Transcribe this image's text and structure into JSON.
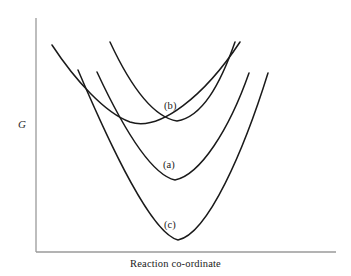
{
  "figure": {
    "kind": "free-energy-vs-reaction-coordinate-diagram",
    "background_color": "#ffffff",
    "curve_color": "#1a1a1a",
    "axis_color": "#9a9a9a"
  },
  "axes": {
    "y_label": "G",
    "x_label": "Reaction co-ordinate",
    "origin": {
      "x": 36,
      "y": 252
    },
    "y_top": {
      "x": 36,
      "y": 18
    },
    "x_right": {
      "x": 336,
      "y": 252
    },
    "ticks": [],
    "grid": false
  },
  "labels": [
    {
      "id": "b",
      "text": "(b)"
    },
    {
      "id": "a",
      "text": "(a)"
    },
    {
      "id": "c",
      "text": "(c)"
    }
  ],
  "chart_data": {
    "type": "line",
    "title": "",
    "xlabel": "Reaction co-ordinate",
    "ylabel": "G",
    "grid": false,
    "legend": "inline-curve-labels",
    "axis_note": "Unlabelled qualitative axes; G increases upward, reaction co-ordinate increases to the right",
    "series": [
      {
        "name": "reactant",
        "label": "",
        "role": "reactant free-energy well",
        "shape": "wide-shallow-parabola",
        "minimum": {
          "x": 130,
          "y": 123
        },
        "start": {
          "x": 52,
          "y": 45
        },
        "end": {
          "x": 240,
          "y": 42
        },
        "path": "M 52 45 C 75 80 105 113 130 122 C 160 132 205 95 240 42"
      },
      {
        "name": "product-b",
        "label": "(b)",
        "role": "product well, least stable",
        "shape": "parabola",
        "minimum": {
          "x": 177,
          "y": 122
        },
        "start": {
          "x": 110,
          "y": 42
        },
        "end": {
          "x": 235,
          "y": 42
        },
        "path": "M 110 42 C 130 85 152 117 177 121 C 202 117 220 85 235 42"
      },
      {
        "name": "product-a",
        "label": "(a)",
        "role": "product well, intermediate stability",
        "shape": "parabola",
        "minimum": {
          "x": 175,
          "y": 181
        },
        "start": {
          "x": 97,
          "y": 72
        },
        "end": {
          "x": 249,
          "y": 73
        },
        "path": "M 97 72 C 124 130 152 175 175 180 C 200 175 229 130 249 73"
      },
      {
        "name": "product-c",
        "label": "(c)",
        "role": "product well, most stable",
        "shape": "parabola",
        "minimum": {
          "x": 178,
          "y": 241
        },
        "start": {
          "x": 78,
          "y": 70
        },
        "end": {
          "x": 268,
          "y": 73
        },
        "path": "M 78 70 C 112 150 152 234 178 240 C 208 234 244 150 268 73"
      }
    ]
  }
}
